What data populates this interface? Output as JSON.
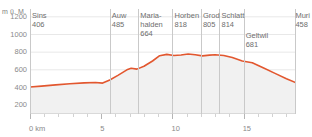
{
  "chart_data": {
    "type": "area",
    "title": "",
    "subtitle": "",
    "xlabel": "0 km",
    "ylabel": "m ü. M.",
    "xlim": [
      0,
      18.6
    ],
    "ylim": [
      100,
      1300
    ],
    "grid": true,
    "legend_position": "none",
    "line_color": "#e2572f",
    "fill_color": "#f0f0f0",
    "x_ticks": [
      {
        "value": 0,
        "label": "0 km"
      },
      {
        "value": 5,
        "label": "5"
      },
      {
        "value": 10,
        "label": "10"
      },
      {
        "value": 15,
        "label": "15"
      }
    ],
    "y_ticks": [
      {
        "value": 1200,
        "label": "1200"
      },
      {
        "value": 1000,
        "label": "1000"
      },
      {
        "value": 800,
        "label": "800"
      },
      {
        "value": 600,
        "label": "600"
      },
      {
        "value": 400,
        "label": "400"
      },
      {
        "value": 200,
        "label": "200"
      }
    ],
    "x": [
      0.0,
      0.8,
      1.8,
      2.8,
      3.8,
      4.6,
      5.1,
      5.6,
      6.2,
      6.8,
      7.1,
      7.5,
      8.0,
      8.6,
      9.1,
      9.6,
      10.1,
      10.6,
      11.1,
      11.6,
      12.1,
      12.6,
      13.0,
      13.6,
      14.2,
      14.9,
      15.6,
      16.4,
      17.2,
      18.0,
      18.6
    ],
    "y": [
      406,
      416,
      430,
      442,
      452,
      456,
      450,
      485,
      540,
      600,
      618,
      608,
      640,
      700,
      760,
      775,
      762,
      768,
      780,
      770,
      758,
      766,
      770,
      762,
      740,
      700,
      681,
      620,
      560,
      500,
      458
    ],
    "series": [
      {
        "name": "Höhenprofil",
        "values": [
          406,
          416,
          430,
          442,
          452,
          456,
          450,
          485,
          540,
          600,
          618,
          608,
          640,
          700,
          760,
          775,
          762,
          768,
          780,
          770,
          758,
          766,
          770,
          762,
          740,
          700,
          681,
          620,
          560,
          500,
          458
        ]
      }
    ],
    "waypoints": [
      {
        "name": "Sins",
        "elevation": "406",
        "km": 0.0,
        "label_lines": [
          "Sins"
        ],
        "rule": true
      },
      {
        "name": "Auw",
        "elevation": "485",
        "km": 5.6,
        "label_lines": [
          "Auw"
        ],
        "rule": true
      },
      {
        "name": "Maria-halden",
        "elevation": "664",
        "km": 7.6,
        "label_lines": [
          "Maria-",
          "halden"
        ],
        "rule": true
      },
      {
        "name": "Horben",
        "elevation": "818",
        "km": 10.0,
        "label_lines": [
          "Horben"
        ],
        "rule": true
      },
      {
        "name": "Grod",
        "elevation": "805",
        "km": 12.0,
        "label_lines": [
          "Grod"
        ],
        "rule": true
      },
      {
        "name": "Schlatt",
        "elevation": "814",
        "km": 13.3,
        "label_lines": [
          "Schlatt"
        ],
        "rule": true
      },
      {
        "name": "Geltwil",
        "elevation": "681",
        "km": 15.0,
        "label_lines": [
          "Geltwil"
        ],
        "rule": true
      },
      {
        "name": "Muri",
        "elevation": "458",
        "km": 18.6,
        "label_lines": [
          "Muri"
        ],
        "rule": true
      }
    ]
  }
}
